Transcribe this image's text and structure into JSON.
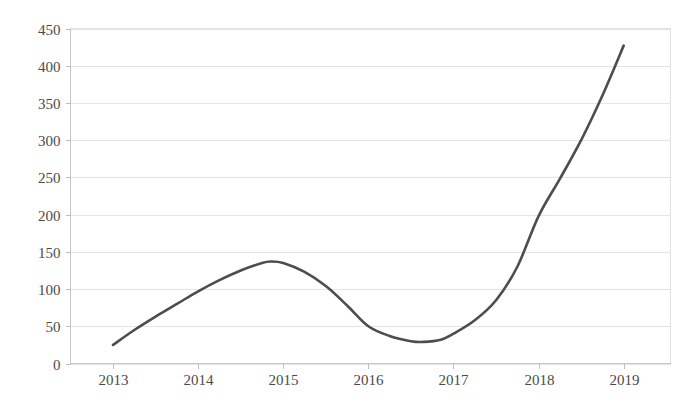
{
  "chart_data": {
    "type": "line",
    "title": "",
    "subtitle": "",
    "xlabel": "",
    "ylabel": "",
    "categories": [
      "2013",
      "2014",
      "2015",
      "2016",
      "2017",
      "2018",
      "2019"
    ],
    "x": [
      2013,
      2014,
      2015,
      2016,
      2017,
      2018,
      2019
    ],
    "series": [
      {
        "name": "",
        "values": [
          25,
          97,
          135,
          50,
          40,
          198,
          427
        ],
        "color": "#4d4d4d",
        "line_width": 2.6,
        "smooth": true,
        "markers": false
      }
    ],
    "annotations": [
      {
        "label": "local maximum",
        "x": 2014.85,
        "y": 137
      },
      {
        "label": "local minimum",
        "x": 2016.65,
        "y": 29
      }
    ],
    "dense_points": [
      {
        "x": 2013.0,
        "y": 25
      },
      {
        "x": 2013.25,
        "y": 45
      },
      {
        "x": 2013.5,
        "y": 63
      },
      {
        "x": 2013.75,
        "y": 80
      },
      {
        "x": 2014.0,
        "y": 97
      },
      {
        "x": 2014.25,
        "y": 112
      },
      {
        "x": 2014.5,
        "y": 125
      },
      {
        "x": 2014.75,
        "y": 135
      },
      {
        "x": 2014.85,
        "y": 137
      },
      {
        "x": 2015.0,
        "y": 135
      },
      {
        "x": 2015.25,
        "y": 123
      },
      {
        "x": 2015.5,
        "y": 104
      },
      {
        "x": 2015.75,
        "y": 78
      },
      {
        "x": 2016.0,
        "y": 50
      },
      {
        "x": 2016.25,
        "y": 37
      },
      {
        "x": 2016.5,
        "y": 30
      },
      {
        "x": 2016.65,
        "y": 29
      },
      {
        "x": 2016.85,
        "y": 32
      },
      {
        "x": 2017.0,
        "y": 40
      },
      {
        "x": 2017.25,
        "y": 58
      },
      {
        "x": 2017.5,
        "y": 85
      },
      {
        "x": 2017.75,
        "y": 130
      },
      {
        "x": 2018.0,
        "y": 198
      },
      {
        "x": 2018.25,
        "y": 248
      },
      {
        "x": 2018.5,
        "y": 300
      },
      {
        "x": 2018.75,
        "y": 360
      },
      {
        "x": 2019.0,
        "y": 427
      }
    ],
    "y_ticks": [
      0,
      50,
      100,
      150,
      200,
      250,
      300,
      350,
      400,
      450
    ],
    "y_tick_labels": [
      "0",
      "50",
      "100",
      "150",
      "200",
      "250",
      "300",
      "350",
      "400",
      "450"
    ],
    "x_tick_labels": [
      "2013",
      "2014",
      "2015",
      "2016",
      "2017",
      "2018",
      "2019"
    ],
    "ylim": [
      0,
      450
    ],
    "xlim": [
      2012.5,
      2019.55
    ],
    "grid": true,
    "grid_axis": "y",
    "legend": false,
    "legend_position": "none",
    "colors": {
      "line": "#4d4d4d",
      "grid": "#e4e4e4",
      "axis": "#c8c8c8",
      "text": "#4a4a4a",
      "background": "#ffffff",
      "plot_border": "#e0e0e0"
    }
  }
}
